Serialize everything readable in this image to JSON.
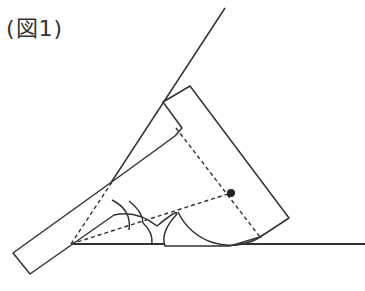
{
  "figure": {
    "caption": "(図1)",
    "line_color": "#333333",
    "dot_color": "#222222"
  },
  "diagram": {
    "vertex": [
      71,
      244
    ],
    "baseline_end": [
      365,
      244
    ],
    "slant_line_end": [
      225,
      8
    ],
    "tool_arm_corners": [
      [
        13,
        253
      ],
      [
        30,
        274
      ],
      [
        175,
        174
      ],
      [
        163,
        102
      ]
    ],
    "tool_head_corners": [
      [
        163,
        102
      ],
      [
        190,
        86
      ],
      [
        289,
        218
      ],
      [
        260,
        237
      ]
    ],
    "center_dot": [
      231,
      193
    ],
    "arcs": 3,
    "dashed_lines": 3
  }
}
